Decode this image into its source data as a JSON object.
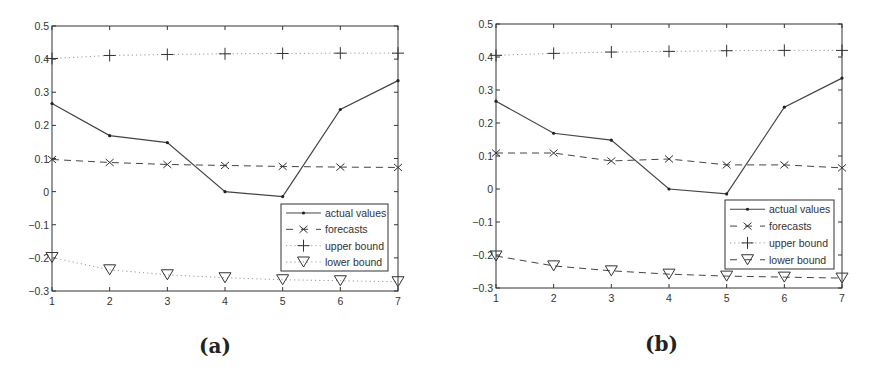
{
  "figures": [
    {
      "label": "(a)",
      "legend": [
        "actual values",
        "forecasts",
        "upper bound",
        "lower bound"
      ]
    },
    {
      "label": "(b)",
      "legend": [
        "actual values",
        "forecasts",
        "upper bound",
        "lower bound"
      ]
    }
  ],
  "chart_data": [
    {
      "type": "line",
      "title": "(a)",
      "xlabel": "",
      "ylabel": "",
      "x": [
        1,
        2,
        3,
        4,
        5,
        6,
        7
      ],
      "xlim": [
        1,
        7
      ],
      "ylim": [
        -0.3,
        0.5
      ],
      "xticks": [
        1,
        2,
        3,
        4,
        5,
        6,
        7
      ],
      "yticks": [
        -0.3,
        -0.2,
        -0.1,
        0,
        0.1,
        0.2,
        0.3,
        0.4,
        0.5
      ],
      "grid": false,
      "legend_position": "lower right",
      "series": [
        {
          "name": "actual values",
          "style": "solid",
          "marker": "dot",
          "values": [
            0.266,
            0.169,
            0.148,
            0.0,
            -0.015,
            0.248,
            0.335
          ]
        },
        {
          "name": "forecasts",
          "style": "dashed",
          "marker": "x",
          "values": [
            0.097,
            0.088,
            0.082,
            0.079,
            0.076,
            0.074,
            0.073
          ]
        },
        {
          "name": "upper bound",
          "style": "dotted",
          "marker": "+",
          "values": [
            0.402,
            0.411,
            0.414,
            0.416,
            0.417,
            0.418,
            0.418
          ]
        },
        {
          "name": "lower bound",
          "style": "dotted",
          "marker": "triangle-down",
          "values": [
            -0.199,
            -0.236,
            -0.251,
            -0.26,
            -0.266,
            -0.269,
            -0.272
          ]
        }
      ]
    },
    {
      "type": "line",
      "title": "(b)",
      "xlabel": "",
      "ylabel": "",
      "x": [
        1,
        2,
        3,
        4,
        5,
        6,
        7
      ],
      "xlim": [
        1,
        7
      ],
      "ylim": [
        -0.3,
        0.5
      ],
      "xticks": [
        1,
        2,
        3,
        4,
        5,
        6,
        7
      ],
      "yticks": [
        -0.3,
        -0.2,
        -0.1,
        0,
        0.1,
        0.2,
        0.3,
        0.4,
        0.5
      ],
      "grid": false,
      "legend_position": "lower right",
      "series": [
        {
          "name": "actual values",
          "style": "solid",
          "marker": "dot",
          "values": [
            0.266,
            0.169,
            0.148,
            0.0,
            -0.015,
            0.248,
            0.336
          ]
        },
        {
          "name": "forecasts",
          "style": "dashed",
          "marker": "x",
          "values": [
            0.109,
            0.109,
            0.085,
            0.091,
            0.073,
            0.073,
            0.064
          ]
        },
        {
          "name": "upper bound",
          "style": "dotted",
          "marker": "+",
          "values": [
            0.405,
            0.411,
            0.415,
            0.417,
            0.419,
            0.42,
            0.42
          ]
        },
        {
          "name": "lower bound",
          "style": "dashed",
          "marker": "triangle-down",
          "values": [
            -0.203,
            -0.233,
            -0.248,
            -0.258,
            -0.264,
            -0.267,
            -0.27
          ]
        }
      ]
    }
  ]
}
